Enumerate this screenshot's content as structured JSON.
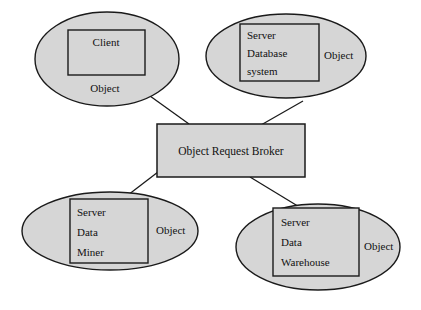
{
  "diagram": {
    "background_color": "#ffffff",
    "shape_fill_color": "#d6d6d6",
    "shape_stroke_color": "#1a1a1a",
    "text_color": "#111111",
    "broker": {
      "label": "Object Request Broker"
    },
    "nodes": [
      {
        "id": "client",
        "inner_lines": [
          "Client"
        ],
        "outer_label": "Object",
        "outer_label_position": "below"
      },
      {
        "id": "server-database-system",
        "inner_lines": [
          "Server",
          "Database",
          "system"
        ],
        "outer_label": "Object",
        "outer_label_position": "right"
      },
      {
        "id": "server-data-miner",
        "inner_lines": [
          "Server",
          "Data",
          "Miner"
        ],
        "outer_label": "Object",
        "outer_label_position": "right"
      },
      {
        "id": "server-data-warehouse",
        "inner_lines": [
          "Server",
          "Data",
          "Warehouse"
        ],
        "outer_label": "Object",
        "outer_label_position": "right"
      }
    ]
  }
}
